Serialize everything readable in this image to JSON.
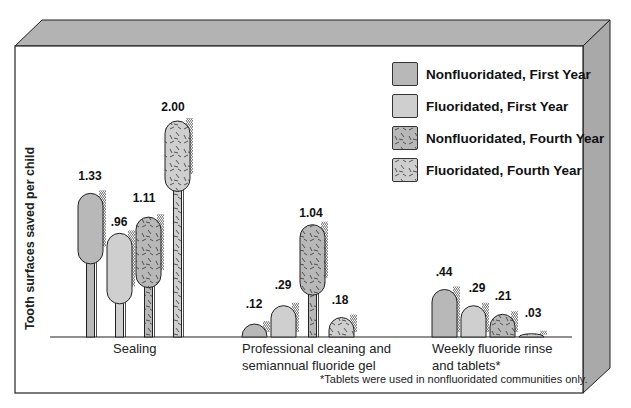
{
  "chart_data": {
    "type": "bar",
    "title": "",
    "xlabel": "",
    "ylabel": "Tooth surfaces saved per child",
    "categories": [
      "Sealing",
      "Professional cleaning and semiannual fluoride gel",
      "Weekly fluoride rinse and tablets*"
    ],
    "category_lines": [
      [
        "Sealing"
      ],
      [
        "Professional cleaning and",
        "semiannual fluoride gel"
      ],
      [
        "Weekly fluoride rinse",
        "and tablets*"
      ]
    ],
    "series": [
      {
        "name": "Nonfluoridated, First Year",
        "values": [
          1.33,
          0.12,
          0.44
        ],
        "labels": [
          "1.33",
          ".12",
          ".44"
        ],
        "color": "#b8b8b8",
        "pattern": "solid"
      },
      {
        "name": "Fluoridated, First Year",
        "values": [
          0.96,
          0.29,
          0.29
        ],
        "labels": [
          ".96",
          ".29",
          ".29"
        ],
        "color": "#cfcfcf",
        "pattern": "solid"
      },
      {
        "name": "Nonfluoridated, Fourth Year",
        "values": [
          1.11,
          1.04,
          0.21
        ],
        "labels": [
          "1.11",
          "1.04",
          ".21"
        ],
        "color": "#b8b8b8",
        "pattern": "dashes"
      },
      {
        "name": "Fluoridated, Fourth Year",
        "values": [
          2.0,
          0.18,
          0.03
        ],
        "labels": [
          "2.00",
          ".18",
          ".03"
        ],
        "color": "#cfcfcf",
        "pattern": "dashes"
      }
    ],
    "ylim": [
      0,
      2.1
    ],
    "grid": false,
    "legend_position": "upper right",
    "bar_style": "toothbrush pictograph",
    "footnote": "*Tablets were used in nonfluoridated communities only."
  },
  "legend": [
    {
      "label": "Nonfluoridated, First Year"
    },
    {
      "label": "Fluoridated, First Year"
    },
    {
      "label": "Nonfluoridated, Fourth Year"
    },
    {
      "label": "Fluoridated, Fourth Year"
    }
  ],
  "axis": {
    "ylabel": "Tooth surfaces saved per child"
  },
  "categories": {
    "sealing": {
      "line1": "Sealing"
    },
    "professional": {
      "line1": "Professional cleaning and",
      "line2": "semiannual fluoride gel"
    },
    "weekly": {
      "line1": "Weekly fluoride rinse",
      "line2": "and tablets*"
    }
  },
  "values": {
    "sealing": [
      "1.33",
      ".96",
      "1.11",
      "2.00"
    ],
    "professional": [
      ".12",
      ".29",
      "1.04",
      ".18"
    ],
    "weekly": [
      ".44",
      ".29",
      ".21",
      ".03"
    ]
  },
  "footnote": "*Tablets were used in nonfluoridated communities only.",
  "colors": {
    "frame_side": "#a9a9a9",
    "frame_top": "#b3b3b3",
    "bar_dark": "#b8b8b8",
    "bar_light": "#cfcfcf",
    "outline": "#222222"
  }
}
